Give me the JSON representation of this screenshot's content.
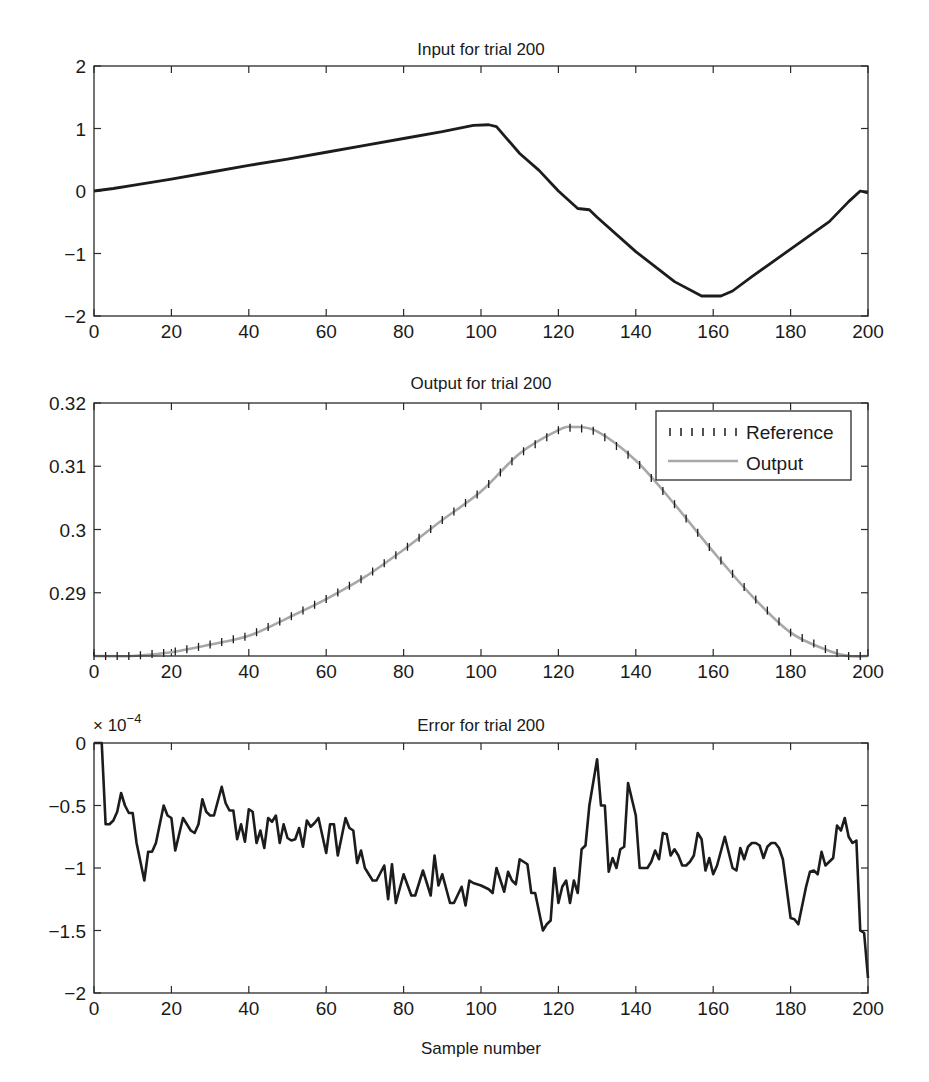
{
  "figure": {
    "xlabel": "Sample number"
  },
  "chart_data": [
    {
      "type": "line",
      "title": "Input for trial 200",
      "xlabel": "",
      "ylabel": "",
      "xlim": [
        0,
        200
      ],
      "ylim": [
        -2,
        2
      ],
      "xticks": [
        "0",
        "20",
        "40",
        "60",
        "80",
        "100",
        "120",
        "140",
        "160",
        "180",
        "200"
      ],
      "yticks": [
        "2",
        "1",
        "0",
        "−1",
        "−2"
      ],
      "ytick_values": [
        2,
        1,
        0,
        -1,
        -2
      ],
      "grid": false,
      "series": [
        {
          "name": "Input",
          "x": [
            0,
            5,
            10,
            20,
            30,
            40,
            50,
            60,
            70,
            80,
            90,
            98,
            102,
            104,
            110,
            115,
            120,
            125,
            128,
            130,
            140,
            150,
            157,
            162,
            165,
            170,
            180,
            190,
            195,
            198,
            200
          ],
          "y": [
            0.0,
            0.04,
            0.09,
            0.19,
            0.3,
            0.41,
            0.51,
            0.62,
            0.73,
            0.84,
            0.95,
            1.05,
            1.06,
            1.03,
            0.6,
            0.33,
            0.0,
            -0.28,
            -0.3,
            -0.42,
            -0.97,
            -1.45,
            -1.68,
            -1.68,
            -1.6,
            -1.37,
            -0.93,
            -0.49,
            -0.17,
            0.0,
            -0.03
          ]
        }
      ]
    },
    {
      "type": "line",
      "title": "Output for trial 200",
      "xlabel": "",
      "ylabel": "",
      "xlim": [
        0,
        200
      ],
      "ylim": [
        0.28,
        0.32
      ],
      "xticks": [
        "0",
        "20",
        "40",
        "60",
        "80",
        "100",
        "120",
        "140",
        "160",
        "180",
        "200"
      ],
      "yticks": [
        "0.32",
        "0.31",
        "0.3",
        "0.29"
      ],
      "ytick_values": [
        0.32,
        0.31,
        0.3,
        0.29
      ],
      "grid": false,
      "legend": {
        "position": "upper right",
        "entries": [
          "Reference",
          "Output"
        ]
      },
      "series": [
        {
          "name": "Reference",
          "style": "dotted vertical ticks",
          "x": [
            0,
            10,
            20,
            30,
            40,
            50,
            60,
            70,
            80,
            90,
            100,
            110,
            120,
            124,
            130,
            140,
            150,
            160,
            170,
            180,
            190,
            195,
            200
          ],
          "y": [
            0.28,
            0.28,
            0.2806,
            0.2818,
            0.2832,
            0.286,
            0.289,
            0.2925,
            0.2968,
            0.3015,
            0.306,
            0.312,
            0.3157,
            0.3162,
            0.3155,
            0.3109,
            0.304,
            0.2965,
            0.2895,
            0.2837,
            0.2808,
            0.28,
            0.28
          ]
        },
        {
          "name": "Output",
          "style": "solid gray",
          "x": [
            0,
            10,
            20,
            30,
            40,
            50,
            60,
            70,
            80,
            90,
            100,
            110,
            120,
            124,
            130,
            140,
            150,
            160,
            170,
            180,
            190,
            195,
            200
          ],
          "y": [
            0.28,
            0.28,
            0.2806,
            0.2818,
            0.2832,
            0.286,
            0.289,
            0.2925,
            0.2968,
            0.3015,
            0.306,
            0.312,
            0.3157,
            0.3162,
            0.3155,
            0.3109,
            0.304,
            0.2965,
            0.2895,
            0.2837,
            0.2808,
            0.28,
            0.28
          ]
        }
      ]
    },
    {
      "type": "line",
      "title": "Error for trial 200",
      "xlabel": "Sample number",
      "ylabel": "",
      "xlim": [
        0,
        200
      ],
      "ylim": [
        -2,
        0
      ],
      "y_multiplier": "× 10",
      "y_multiplier_exponent": "−4",
      "xticks": [
        "0",
        "20",
        "40",
        "60",
        "80",
        "100",
        "120",
        "140",
        "160",
        "180",
        "200"
      ],
      "yticks": [
        "0",
        "−0.5",
        "−1",
        "−1.5",
        "−2"
      ],
      "ytick_values": [
        0,
        -0.5,
        -1,
        -1.5,
        -2
      ],
      "grid": false,
      "series": [
        {
          "name": "Error (×1e-4)",
          "x": [
            0,
            2,
            3,
            4,
            5,
            6,
            7,
            8,
            9,
            10,
            11,
            13,
            14,
            15,
            16,
            18,
            19,
            20,
            21,
            23,
            25,
            26,
            27,
            28,
            29,
            30,
            31,
            33,
            34,
            35,
            36,
            37,
            38,
            39,
            40,
            41,
            42,
            43,
            44,
            45,
            46,
            47,
            48,
            49,
            50,
            51,
            52,
            53,
            54,
            55,
            56,
            57,
            58,
            60,
            61,
            62,
            63,
            65,
            66,
            67,
            68,
            69,
            70,
            72,
            73,
            75,
            76,
            77,
            78,
            80,
            82,
            83,
            85,
            87,
            88,
            89,
            90,
            92,
            93,
            95,
            96,
            97,
            98,
            100,
            102,
            103,
            104,
            106,
            107,
            108,
            109,
            110,
            112,
            113,
            114,
            116,
            117,
            118,
            119,
            120,
            121,
            122,
            123,
            124,
            125,
            126,
            127,
            128,
            130,
            131,
            132,
            133,
            134,
            135,
            136,
            137,
            138,
            140,
            141,
            142,
            143,
            144,
            145,
            146,
            147,
            148,
            149,
            150,
            151,
            152,
            153,
            154,
            155,
            156,
            157,
            158,
            159,
            160,
            161,
            163,
            165,
            166,
            167,
            168,
            169,
            170,
            171,
            172,
            173,
            174,
            175,
            176,
            177,
            178,
            180,
            181,
            182,
            184,
            185,
            186,
            187,
            188,
            189,
            190,
            191,
            192,
            193,
            194,
            195,
            196,
            197,
            198,
            199,
            200
          ],
          "y": [
            0,
            0,
            -0.65,
            -0.65,
            -0.62,
            -0.55,
            -0.4,
            -0.5,
            -0.56,
            -0.56,
            -0.8,
            -1.1,
            -0.87,
            -0.87,
            -0.8,
            -0.5,
            -0.58,
            -0.6,
            -0.86,
            -0.6,
            -0.7,
            -0.72,
            -0.65,
            -0.45,
            -0.55,
            -0.58,
            -0.58,
            -0.35,
            -0.48,
            -0.54,
            -0.54,
            -0.77,
            -0.65,
            -0.79,
            -0.53,
            -0.55,
            -0.8,
            -0.7,
            -0.84,
            -0.6,
            -0.63,
            -0.58,
            -0.8,
            -0.65,
            -0.76,
            -0.78,
            -0.77,
            -0.68,
            -0.83,
            -0.62,
            -0.67,
            -0.64,
            -0.6,
            -0.88,
            -0.65,
            -0.65,
            -0.9,
            -0.6,
            -0.68,
            -0.7,
            -0.96,
            -0.86,
            -1.0,
            -1.1,
            -1.1,
            -0.98,
            -1.25,
            -0.97,
            -1.28,
            -1.05,
            -1.22,
            -1.22,
            -1.02,
            -1.22,
            -0.9,
            -1.14,
            -1.05,
            -1.28,
            -1.28,
            -1.15,
            -1.3,
            -1.1,
            -1.12,
            -1.14,
            -1.17,
            -1.2,
            -1.0,
            -1.19,
            -1.03,
            -1.1,
            -1.13,
            -0.93,
            -0.97,
            -1.2,
            -1.2,
            -1.5,
            -1.45,
            -1.42,
            -1.0,
            -1.28,
            -1.15,
            -1.1,
            -1.28,
            -1.1,
            -1.2,
            -0.85,
            -0.82,
            -0.5,
            -0.13,
            -0.5,
            -0.5,
            -1.03,
            -0.92,
            -1.0,
            -0.85,
            -0.83,
            -0.32,
            -0.58,
            -1.0,
            -1.0,
            -1.0,
            -0.95,
            -0.86,
            -0.93,
            -0.72,
            -0.73,
            -0.9,
            -0.85,
            -0.9,
            -0.98,
            -0.98,
            -0.95,
            -0.9,
            -0.72,
            -0.77,
            -1.02,
            -0.92,
            -1.05,
            -0.98,
            -0.75,
            -1.0,
            -1.02,
            -0.84,
            -0.93,
            -0.83,
            -0.8,
            -0.8,
            -0.82,
            -0.92,
            -0.83,
            -0.8,
            -0.8,
            -0.84,
            -0.93,
            -1.4,
            -1.41,
            -1.45,
            -1.15,
            -1.03,
            -1.02,
            -1.05,
            -0.87,
            -0.98,
            -0.95,
            -0.92,
            -0.66,
            -0.7,
            -0.6,
            -0.75,
            -0.8,
            -0.78,
            -1.5,
            -1.52,
            -1.88
          ]
        }
      ]
    }
  ]
}
